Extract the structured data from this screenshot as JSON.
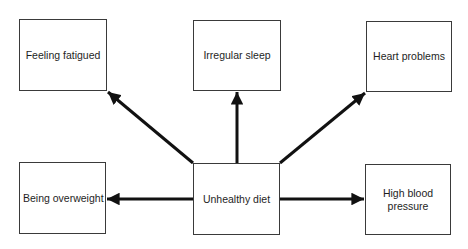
{
  "diagram": {
    "center": {
      "id": "diet",
      "label": "Unhealthy diet"
    },
    "effects": [
      {
        "id": "fatigued",
        "label": "Feeling fatigued"
      },
      {
        "id": "sleep",
        "label": "Irregular sleep"
      },
      {
        "id": "heart",
        "label": "Heart problems"
      },
      {
        "id": "overweight",
        "label": "Being overweight"
      },
      {
        "id": "bp",
        "label": "High blood\npressure"
      }
    ],
    "edges": [
      {
        "from": "diet",
        "to": "fatigued"
      },
      {
        "from": "diet",
        "to": "sleep"
      },
      {
        "from": "diet",
        "to": "heart"
      },
      {
        "from": "diet",
        "to": "overweight"
      },
      {
        "from": "diet",
        "to": "bp"
      }
    ],
    "colors": {
      "stroke": "#111111",
      "box_border": "#3a3a3a",
      "text": "#1e1e1e",
      "background": "#ffffff"
    }
  }
}
